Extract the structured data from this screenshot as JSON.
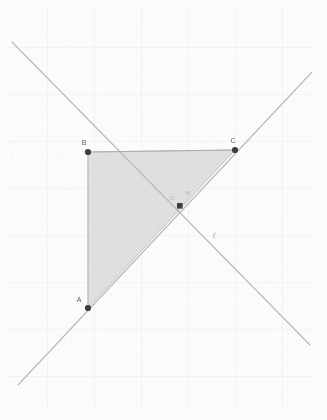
{
  "figure": {
    "canvas": {
      "width": 327,
      "height": 420
    },
    "background_color": "#ffffff",
    "paper_color": "#fbfbfa",
    "grid": {
      "visible": true,
      "spacing": 47,
      "color": "#ececed",
      "minor_color": "#f4f4f3"
    }
  },
  "points": [
    {
      "id": "A",
      "label": "A",
      "x": 88,
      "y": 308,
      "marker": "dot",
      "color": "#3d3d42",
      "label_dx": -7,
      "label_dy": -5
    },
    {
      "id": "B",
      "label": "B",
      "x": 88,
      "y": 152,
      "marker": "dot",
      "color": "#3d3d42",
      "label_dx": -3,
      "label_dy": -6
    },
    {
      "id": "C",
      "label": "C",
      "x": 235,
      "y": 150,
      "marker": "dot",
      "color": "#3d3d42",
      "label_dx": -2,
      "label_dy": -6
    },
    {
      "id": "D",
      "label": "D",
      "x": 180,
      "y": 206,
      "marker": "square",
      "color": "#3d3d42",
      "label_dx": -8,
      "label_dy": -4
    },
    {
      "id": "M",
      "label": "M",
      "x": 188,
      "y": 195,
      "marker": "none",
      "color": "#b6b6ba",
      "label_dx": 0,
      "label_dy": 0
    }
  ],
  "lines": [
    {
      "id": "ascending-line",
      "label": "",
      "x1": 18,
      "y1": 385,
      "x2": 312,
      "y2": 72,
      "color": "#b9b9bd",
      "width": 1,
      "through": [
        "A",
        "D",
        "C"
      ]
    },
    {
      "id": "descending-line",
      "label": "ℓ",
      "x1": 12,
      "y1": 42,
      "x2": 310,
      "y2": 345,
      "color": "#b9b9bd",
      "width": 1,
      "through": [
        "D"
      ],
      "label_x": 214,
      "label_y": 238
    }
  ],
  "polygons": [
    {
      "id": "triangle-ABC",
      "vertices": [
        "A",
        "B",
        "C"
      ],
      "points_path": "88,308 88,152 235,150",
      "fill": "#d8d8d8",
      "fill_opacity": 0.72,
      "stroke": "#bdbdc1",
      "stroke_width": 1
    }
  ],
  "segments": [
    {
      "id": "segment-BC",
      "x1": 88,
      "y1": 152,
      "x2": 235,
      "y2": 150,
      "color": "#b2b2b6",
      "width": 1
    },
    {
      "id": "segment-AB",
      "x1": 88,
      "y1": 308,
      "x2": 88,
      "y2": 152,
      "color": "#c3c3c7",
      "width": 1
    }
  ],
  "labels": {
    "point_a": "A",
    "point_b": "B",
    "point_c": "C",
    "point_d": "D",
    "point_m": "M",
    "line_l": "ℓ"
  }
}
